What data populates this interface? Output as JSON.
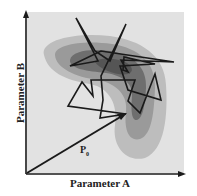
{
  "figure": {
    "x_axis_label": "Parameter A",
    "y_axis_label": "Parameter B",
    "vector_label": "P",
    "vector_label_subscript": "0",
    "colors": {
      "background": "#e2e2e2",
      "contour_outer": "#bdbdbd",
      "contour_mid": "#9a9a9a",
      "contour_inner": "#6e6e6e",
      "contour_core": "#555555",
      "path": "#1a1a1a",
      "axes": "#1a1a1a"
    },
    "path_description": "jagged random-walk trajectory over probability density contours, starting at tip of vector P0"
  }
}
